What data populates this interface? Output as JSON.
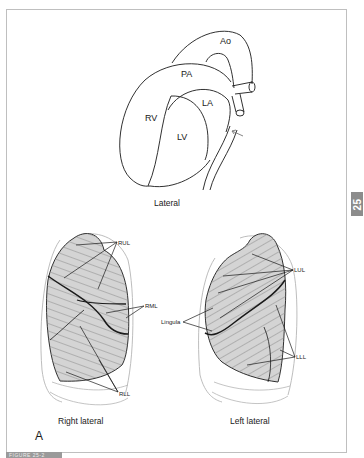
{
  "figure": {
    "panel_letter": "A",
    "side_tab_label": "25",
    "caption_bar_text": "FIGURE 25-2"
  },
  "heart_view": {
    "caption": "Lateral",
    "labels": {
      "aorta": "Ao",
      "pulmonary_artery": "PA",
      "right_ventricle": "RV",
      "left_atrium": "LA",
      "left_ventricle": "LV"
    }
  },
  "right_lung": {
    "caption": "Right lateral",
    "lobes": {
      "upper": "RUL",
      "middle": "RML",
      "lower": "RLL"
    }
  },
  "left_lung": {
    "caption": "Left lateral",
    "lobes": {
      "upper": "LUL",
      "lingula": "Lingula",
      "lower": "LLL"
    }
  },
  "colors": {
    "line": "#1a1a1a",
    "lung_fill": "#d4d4d4",
    "hatch": "#8a8a8a",
    "rib": "#b5b5b5",
    "frame": "#bfbfbf",
    "tab": "#8c8c8c"
  }
}
